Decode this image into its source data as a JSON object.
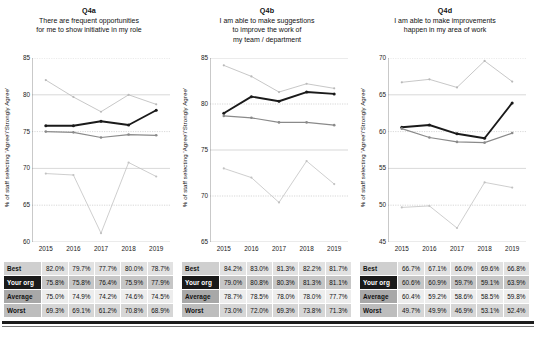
{
  "charts": [
    {
      "code": "Q4a",
      "subtitle_lines": [
        "There are frequent opportunities",
        "for me to show initiative in my role"
      ],
      "ylabel": "% of staff selecting 'Agree'/'Strongly Agree'",
      "chart_data": {
        "type": "line",
        "title": "Q4a",
        "xlabel": "",
        "ylabel": "% of staff selecting 'Agree'/'Strongly Agree'",
        "categories": [
          "2015",
          "2016",
          "2017",
          "2018",
          "2019"
        ],
        "ylim": [
          60,
          85
        ],
        "yticks": [
          60,
          65,
          70,
          75,
          80,
          85
        ],
        "grid": true,
        "legend": "none",
        "series": [
          {
            "name": "Best",
            "values": [
              82.0,
              79.7,
              77.7,
              80.0,
              78.7
            ]
          },
          {
            "name": "Your org",
            "values": [
              75.8,
              75.8,
              76.4,
              75.9,
              77.9
            ]
          },
          {
            "name": "Average",
            "values": [
              75.0,
              74.9,
              74.2,
              74.6,
              74.5
            ]
          },
          {
            "name": "Worst",
            "values": [
              69.3,
              69.1,
              61.2,
              70.8,
              68.9
            ]
          }
        ]
      },
      "table": {
        "rows": [
          {
            "label": "Best",
            "values": [
              "82.0%",
              "79.7%",
              "77.7%",
              "80.0%",
              "78.7%"
            ]
          },
          {
            "label": "Your org",
            "values": [
              "75.8%",
              "75.8%",
              "76.4%",
              "75.9%",
              "77.9%"
            ]
          },
          {
            "label": "Average",
            "values": [
              "75.0%",
              "74.9%",
              "74.2%",
              "74.6%",
              "74.5%"
            ]
          },
          {
            "label": "Worst",
            "values": [
              "69.3%",
              "69.1%",
              "61.2%",
              "70.8%",
              "68.9%"
            ]
          }
        ]
      }
    },
    {
      "code": "Q4b",
      "subtitle_lines": [
        "I am able to make suggestions",
        "to improve the work of",
        "my team / department"
      ],
      "ylabel": "% of staff selecting 'Agree'/'Strongly Agree'",
      "chart_data": {
        "type": "line",
        "title": "Q4b",
        "xlabel": "",
        "ylabel": "% of staff selecting 'Agree'/'Strongly Agree'",
        "categories": [
          "2015",
          "2016",
          "2017",
          "2018",
          "2019"
        ],
        "ylim": [
          65,
          85
        ],
        "yticks": [
          65,
          70,
          75,
          80,
          85
        ],
        "grid": true,
        "legend": "none",
        "series": [
          {
            "name": "Best",
            "values": [
              84.2,
              83.0,
              81.3,
              82.2,
              81.7
            ]
          },
          {
            "name": "Your org",
            "values": [
              79.0,
              80.8,
              80.3,
              81.3,
              81.1
            ]
          },
          {
            "name": "Average",
            "values": [
              78.7,
              78.5,
              78.0,
              78.0,
              77.7
            ]
          },
          {
            "name": "Worst",
            "values": [
              73.0,
              72.0,
              69.3,
              73.8,
              71.3
            ]
          }
        ]
      },
      "table": {
        "rows": [
          {
            "label": "Best",
            "values": [
              "84.2%",
              "83.0%",
              "81.3%",
              "82.2%",
              "81.7%"
            ]
          },
          {
            "label": "Your org",
            "values": [
              "79.0%",
              "80.8%",
              "80.3%",
              "81.3%",
              "81.1%"
            ]
          },
          {
            "label": "Average",
            "values": [
              "78.7%",
              "78.5%",
              "78.0%",
              "78.0%",
              "77.7%"
            ]
          },
          {
            "label": "Worst",
            "values": [
              "73.0%",
              "72.0%",
              "69.3%",
              "73.8%",
              "71.3%"
            ]
          }
        ]
      }
    },
    {
      "code": "Q4d",
      "subtitle_lines": [
        "I am able to make improvements",
        "happen in my area of work"
      ],
      "ylabel": "% of staff selecting 'Agree'/'Strongly Agree'",
      "chart_data": {
        "type": "line",
        "title": "Q4d",
        "xlabel": "",
        "ylabel": "% of staff selecting 'Agree'/'Strongly Agree'",
        "categories": [
          "2015",
          "2016",
          "2017",
          "2018",
          "2019"
        ],
        "ylim": [
          45,
          70
        ],
        "yticks": [
          45,
          50,
          55,
          60,
          65,
          70
        ],
        "grid": true,
        "legend": "none",
        "series": [
          {
            "name": "Best",
            "values": [
              66.7,
              67.1,
              66.0,
              69.6,
              66.8
            ]
          },
          {
            "name": "Your org",
            "values": [
              60.6,
              60.9,
              59.7,
              59.1,
              63.9
            ]
          },
          {
            "name": "Average",
            "values": [
              60.4,
              59.2,
              58.6,
              58.5,
              59.8
            ]
          },
          {
            "name": "Worst",
            "values": [
              49.7,
              49.9,
              46.9,
              53.1,
              52.4
            ]
          }
        ]
      },
      "table": {
        "rows": [
          {
            "label": "Best",
            "values": [
              "66.7%",
              "67.1%",
              "66.0%",
              "69.6%",
              "66.8%"
            ]
          },
          {
            "label": "Your org",
            "values": [
              "60.6%",
              "60.9%",
              "59.7%",
              "59.1%",
              "63.9%"
            ]
          },
          {
            "label": "Average",
            "values": [
              "60.4%",
              "59.2%",
              "58.6%",
              "58.5%",
              "59.8%"
            ]
          },
          {
            "label": "Worst",
            "values": [
              "49.7%",
              "49.9%",
              "46.9%",
              "53.1%",
              "52.4%"
            ]
          }
        ]
      }
    }
  ],
  "style": {
    "color_best": "#b9b9b9",
    "color_your_org": "#1a1a1a",
    "color_average": "#8a8a8a",
    "color_worst": "#c2c2c2",
    "grid_color": "#bdbdbd"
  }
}
